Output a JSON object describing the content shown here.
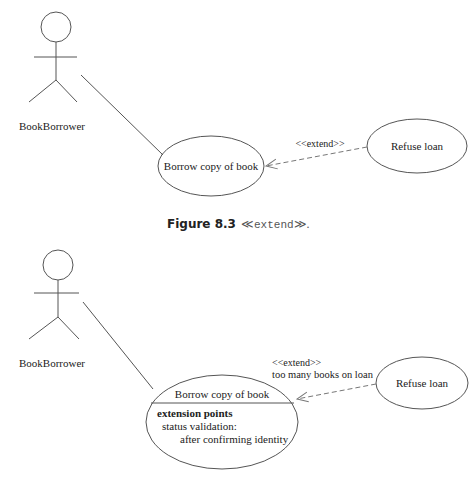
{
  "diagram1": {
    "actor": {
      "label": "BookBorrower"
    },
    "base_use_case": {
      "label": "Borrow copy of book"
    },
    "extending_use_case": {
      "label": "Refuse loan"
    },
    "relationship": {
      "stereotype": "<<extend>>"
    }
  },
  "caption": {
    "figure_number": "Figure 8.3",
    "left_guillemet": "≪",
    "keyword": "extend",
    "right_guillemet": "≫",
    "period": "."
  },
  "diagram2": {
    "actor": {
      "label": "BookBorrower"
    },
    "base_use_case": {
      "label": "Borrow copy of book",
      "compartment_title": "extension points",
      "extension_point_name": "status validation:",
      "extension_point_detail": "after confirming identity"
    },
    "extending_use_case": {
      "label": "Refuse loan"
    },
    "relationship": {
      "stereotype": "<<extend>>",
      "condition": "too many books on loan"
    }
  },
  "colors": {
    "line": "#555555",
    "text": "#222222",
    "background": "#ffffff"
  }
}
